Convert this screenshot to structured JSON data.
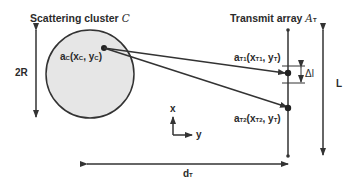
{
  "cluster": {
    "title": "Scattering cluster",
    "title_symbol": "C",
    "point_label_main": "a",
    "point_label_sub": "C",
    "point_coords_open": "(x",
    "point_coords_sub1": "C",
    "point_coords_mid": ", y",
    "point_coords_sub2": "C",
    "point_coords_close": ")",
    "diameter_label": "2R",
    "fill_color": "#e6e6e6"
  },
  "array": {
    "title": "Transmit array",
    "title_symbol": "A",
    "title_symbol_sub": "T",
    "element1": {
      "main": "a",
      "sub": "T1",
      "open": "(x",
      "sub1": "T1",
      "mid": ", y",
      "sub2": "T",
      "close": ")"
    },
    "element2": {
      "main": "a",
      "sub": "T2",
      "open": "(x",
      "sub1": "T2",
      "mid": ", y",
      "sub2": "T",
      "close": ")"
    },
    "spacing_label": "Δl",
    "length_label": "L"
  },
  "axes": {
    "x_label": "x",
    "y_label": "y"
  },
  "distance": {
    "main": "d",
    "sub": "T"
  },
  "line_color": "#333333"
}
